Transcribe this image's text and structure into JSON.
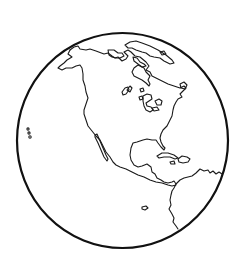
{
  "image": {
    "subject": "Globe line drawing showing the Western Hemisphere",
    "style": "black outline coloring-page",
    "colors": {
      "background": "#ffffff",
      "stroke": "#111111"
    },
    "visible_features": [
      "North America",
      "Greenland",
      "Great Lakes",
      "Baja California",
      "Gulf of Mexico",
      "Caribbean islands",
      "Central America",
      "Northern South America",
      "Hawaiian islands"
    ]
  }
}
